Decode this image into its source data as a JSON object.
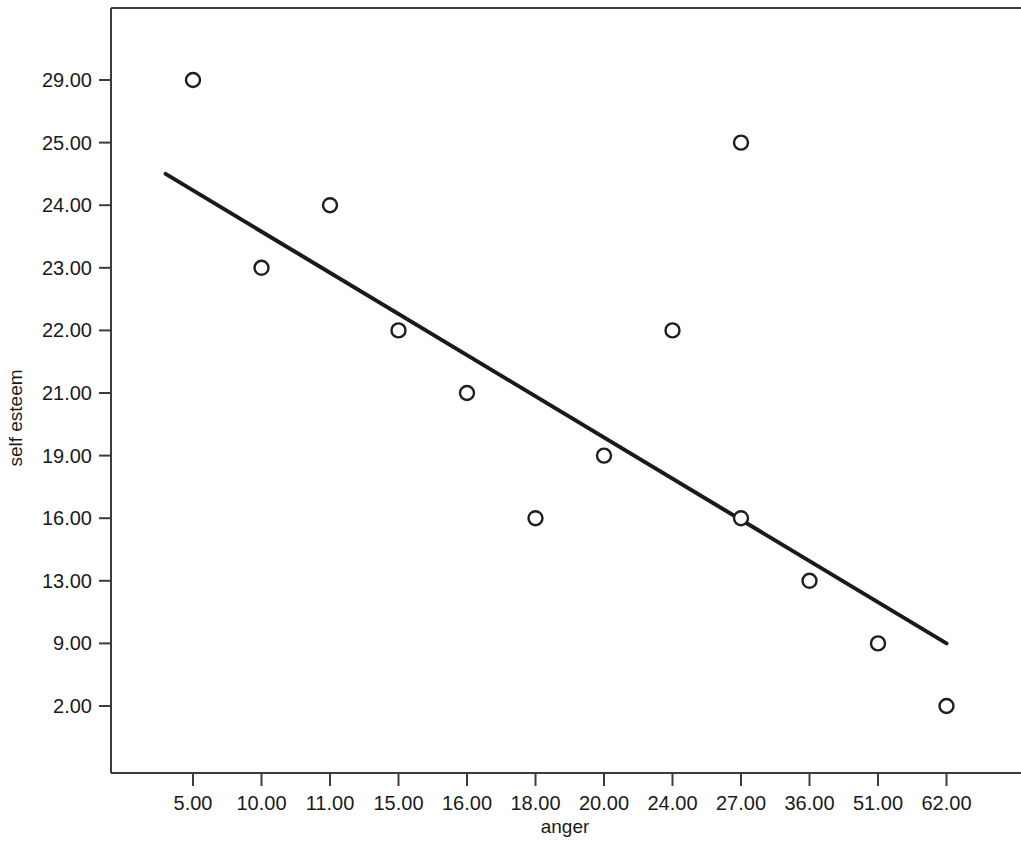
{
  "chart_data": {
    "type": "scatter",
    "title": "",
    "xlabel": "anger",
    "ylabel": "self esteem",
    "grid": false,
    "legend": "none",
    "x_is_categorical": true,
    "y_is_categorical": true,
    "categories": [
      "5.00",
      "10.00",
      "11.00",
      "15.00",
      "16.00",
      "18.00",
      "20.00",
      "24.00",
      "27.00",
      "36.00",
      "51.00",
      "62.00"
    ],
    "xticklabels": [
      "5.00",
      "10.00",
      "11.00",
      "15.00",
      "16.00",
      "18.00",
      "20.00",
      "24.00",
      "27.00",
      "36.00",
      "51.00",
      "62.00"
    ],
    "yticklabels": [
      "29.00",
      "25.00",
      "24.00",
      "23.00",
      "22.00",
      "21.00",
      "19.00",
      "16.00",
      "13.00",
      "9.00",
      "2.00"
    ],
    "points": [
      {
        "x": "5.00",
        "y": "29.00",
        "xi": 0,
        "yi": 0
      },
      {
        "x": "10.00",
        "y": "23.00",
        "xi": 1,
        "yi": 3
      },
      {
        "x": "11.00",
        "y": "24.00",
        "xi": 2,
        "yi": 2
      },
      {
        "x": "15.00",
        "y": "22.00",
        "xi": 3,
        "yi": 4
      },
      {
        "x": "16.00",
        "y": "21.00",
        "xi": 4,
        "yi": 5
      },
      {
        "x": "18.00",
        "y": "16.00",
        "xi": 5,
        "yi": 7
      },
      {
        "x": "20.00",
        "y": "19.00",
        "xi": 6,
        "yi": 6
      },
      {
        "x": "24.00",
        "y": "22.00",
        "xi": 7,
        "yi": 4
      },
      {
        "x": "27.00",
        "y": "25.00",
        "xi": 8,
        "yi": 1
      },
      {
        "x": "27.00",
        "y": "16.00",
        "xi": 8,
        "yi": 7
      },
      {
        "x": "36.00",
        "y": "13.00",
        "xi": 9,
        "yi": 8
      },
      {
        "x": "51.00",
        "y": "9.00",
        "xi": 10,
        "yi": 9
      },
      {
        "x": "62.00",
        "y": "2.00",
        "xi": 11,
        "yi": 10
      }
    ],
    "fit_line": {
      "kind": "linear-regression",
      "x_start_index": -0.4,
      "y_start_value": 24.5,
      "x_end_index": 11.0,
      "y_end_value": 9.0
    },
    "marker": {
      "shape": "open-circle",
      "radius_px": 7,
      "fill": "#ffffff",
      "stroke": "#1f1f1f"
    },
    "colors": {
      "axis": "#3c3c3c",
      "marker_stroke": "#1f1f1f",
      "line": "#1a1a1a",
      "text": "#1a1a1a",
      "background": "#ffffff"
    }
  }
}
